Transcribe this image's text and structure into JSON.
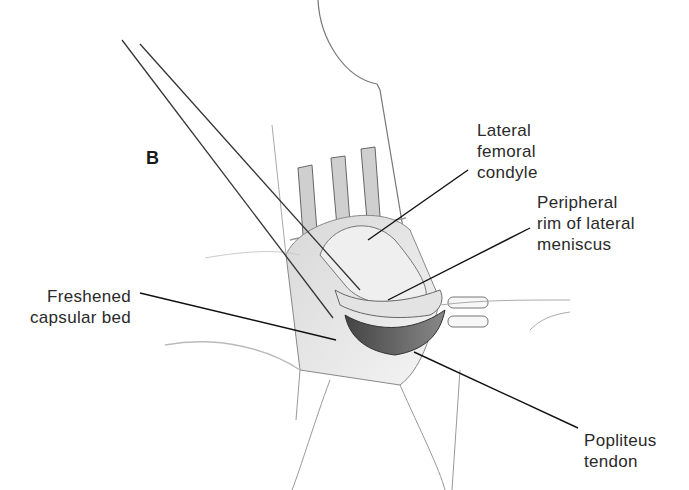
{
  "figure": {
    "panel_letter": "B",
    "labels": {
      "lateral_femoral_condyle": [
        "Lateral",
        "femoral",
        "condyle"
      ],
      "peripheral_rim": [
        "Peripheral",
        "rim of lateral",
        "meniscus"
      ],
      "freshened_capsular_bed": [
        "Freshened",
        "capsular bed"
      ],
      "popliteus_tendon": [
        "Popliteus",
        "tendon"
      ]
    }
  }
}
